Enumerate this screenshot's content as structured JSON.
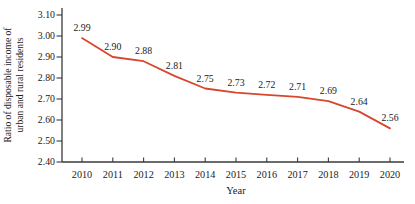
{
  "chart_data": {
    "type": "line",
    "x": [
      "2010",
      "2011",
      "2012",
      "2013",
      "2014",
      "2015",
      "2016",
      "2017",
      "2018",
      "2019",
      "2020"
    ],
    "values": [
      2.99,
      2.9,
      2.88,
      2.81,
      2.75,
      2.73,
      2.72,
      2.71,
      2.69,
      2.64,
      2.56
    ],
    "point_labels": [
      "2.99",
      "2.90",
      "2.88",
      "2.81",
      "2.75",
      "2.73",
      "2.72",
      "2.71",
      "2.69",
      "2.64",
      "2.56"
    ],
    "title": "",
    "xlabel": "Year",
    "ylabel_line1": "Ratio of disposable income of",
    "ylabel_line2": "urban and rural residents",
    "ylim": [
      2.4,
      3.1
    ],
    "yticks": [
      "2.40",
      "2.50",
      "2.60",
      "2.70",
      "2.80",
      "2.90",
      "3.00",
      "3.10"
    ],
    "grid": "off",
    "legend": "none",
    "line_color": "#d9462e",
    "axis_color": "#3a3a3a",
    "text_color": "#1b1b1b"
  }
}
